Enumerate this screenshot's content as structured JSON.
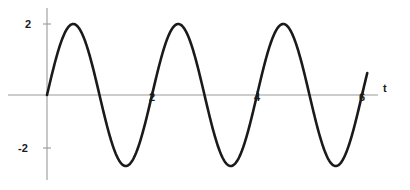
{
  "figure": {
    "background_color": "#ffffff",
    "axis_color": "#9a9a9a",
    "curve_color": "#1a1a1a",
    "width": 410,
    "height": 190
  },
  "axes": {
    "x_axis_name": "t",
    "y_ticks": [
      {
        "label": "2",
        "value": 2
      },
      {
        "label": "-2",
        "value": -2
      }
    ],
    "x_ticks": [
      {
        "label": "2",
        "value": 2
      },
      {
        "label": "4",
        "value": 4
      },
      {
        "label": "6",
        "value": 6
      }
    ]
  },
  "chart_data": {
    "type": "line",
    "title": "",
    "xlabel": "t",
    "ylabel": "",
    "grid": false,
    "legend": null,
    "xlim": [
      0,
      6.5
    ],
    "ylim": [
      -2.6,
      2.6
    ],
    "xticks": [
      2,
      4,
      6
    ],
    "yticks": [
      -2,
      2
    ],
    "series": [
      {
        "name": "2 sin(pi t)",
        "amplitude": 2,
        "period": 2,
        "x": [
          0,
          0.1,
          0.2,
          0.3,
          0.4,
          0.5,
          0.6,
          0.7,
          0.8,
          0.9,
          1.0,
          1.1,
          1.2,
          1.3,
          1.4,
          1.5,
          1.6,
          1.7,
          1.8,
          1.9,
          2.0,
          2.1,
          2.2,
          2.3,
          2.4,
          2.5,
          2.6,
          2.7,
          2.8,
          2.9,
          3.0,
          3.1,
          3.2,
          3.3,
          3.4,
          3.5,
          3.6,
          3.7,
          3.8,
          3.9,
          4.0,
          4.1,
          4.2,
          4.3,
          4.4,
          4.5,
          4.6,
          4.7,
          4.8,
          4.9,
          5.0,
          5.1,
          5.2,
          5.3,
          5.4,
          5.5,
          5.6,
          5.7,
          5.8,
          5.9,
          6.0,
          6.1
        ],
        "y": [
          0,
          0.618,
          1.176,
          1.618,
          1.902,
          2.0,
          1.902,
          1.618,
          1.176,
          0.618,
          0,
          -0.618,
          -1.176,
          -1.618,
          -1.902,
          -2.0,
          -1.902,
          -1.618,
          -1.176,
          -0.618,
          0,
          0.618,
          1.176,
          1.618,
          1.902,
          2.0,
          1.902,
          1.618,
          1.176,
          0.618,
          0,
          -0.618,
          -1.176,
          -1.618,
          -1.902,
          -2.0,
          -1.902,
          -1.618,
          -1.176,
          -0.618,
          0,
          0.618,
          1.176,
          1.618,
          1.902,
          2.0,
          1.902,
          1.618,
          1.176,
          0.618,
          0,
          -0.618,
          -1.176,
          -1.618,
          -1.902,
          -2.0,
          -1.902,
          -1.618,
          -1.176,
          -0.618,
          0,
          0.618
        ]
      }
    ]
  }
}
